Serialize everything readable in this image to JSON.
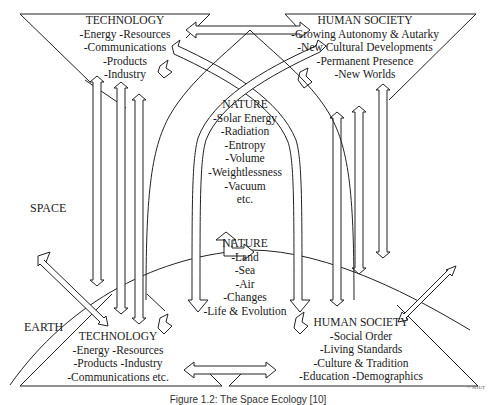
{
  "diagram": {
    "type": "space-ecology-interaction-diagram",
    "regions": {
      "space": "SPACE",
      "earth": "EARTH"
    },
    "nodes": {
      "technology_space": {
        "title": "TECHNOLOGY",
        "lines": [
          "-Energy  -Resources",
          "-Communications",
          "-Products",
          "-Industry"
        ]
      },
      "human_society_space": {
        "title": "HUMAN SOCIETY",
        "lines": [
          "-Growing Autonomy & Autarky",
          "-New Cultural Developments",
          "-Permanent Presence",
          "-New Worlds"
        ]
      },
      "nature_space": {
        "title": "NATURE",
        "lines": [
          "-Solar Energy",
          "-Radiation",
          "-Entropy",
          "-Volume",
          "-Weightlessness",
          "-Vacuum",
          "etc."
        ]
      },
      "nature_earth": {
        "title": "NATURE",
        "lines": [
          "-Land",
          "-Sea",
          "-Air",
          "-Changes",
          "-Life & Evolution"
        ]
      },
      "technology_earth": {
        "title": "TECHNOLOGY",
        "lines": [
          "-Energy  -Resources",
          "-Products  -Industry",
          "-Communications  etc."
        ]
      },
      "human_society_earth": {
        "title": "HUMAN SOCIETY",
        "lines": [
          "-Social Order",
          "-Living Standards",
          "-Culture & Tradition",
          "-Education  -Demographics"
        ]
      }
    },
    "connections": [
      {
        "from": "technology_space",
        "to": "human_society_space",
        "type": "bidirectional"
      },
      {
        "from": "technology_earth",
        "to": "human_society_earth",
        "type": "bidirectional"
      },
      {
        "from": "technology_space",
        "to": "technology_earth",
        "type": "bidirectional-vertical"
      },
      {
        "from": "human_society_space",
        "to": "human_society_earth",
        "type": "bidirectional-vertical"
      },
      {
        "from": "technology_space",
        "to": "human_society_earth",
        "type": "crossing-arch"
      },
      {
        "from": "human_society_space",
        "to": "technology_earth",
        "type": "crossing-arch"
      },
      {
        "from": "nature_space",
        "to": "nature_earth",
        "type": "bidirectional"
      },
      {
        "from": "nature_earth",
        "to": "technology_space",
        "type": "step-arrow"
      },
      {
        "from": "nature_earth",
        "to": "human_society_space",
        "type": "step-arrow"
      },
      {
        "from": "space",
        "to": "earth",
        "type": "diagonal-bidirectional"
      }
    ],
    "caption": "Figure 1.2: The Space Ecology [10]",
    "copyright": "© SHUT"
  }
}
